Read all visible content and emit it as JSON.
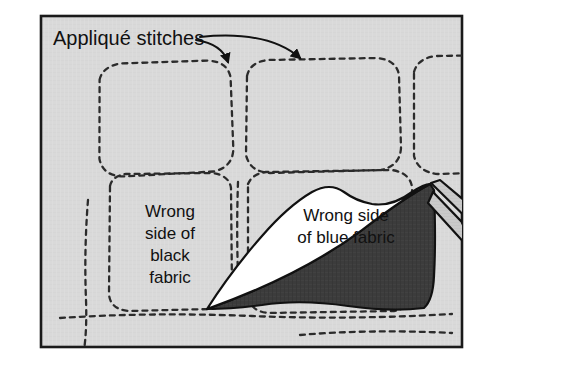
{
  "figure": {
    "frame": {
      "border_color": "#1a1a1a",
      "background_color": "#d9d9d9",
      "page_color": "#ffffff"
    },
    "labels": {
      "callout": {
        "text": "Appliqué stitches",
        "arrows": 2
      },
      "black_fabric": {
        "lines": [
          "Wrong",
          "side of",
          "black",
          "fabric"
        ]
      },
      "blue_fabric": {
        "lines": [
          "Wrong side",
          "of blue fabric"
        ]
      }
    },
    "elements": {
      "stitch_line_name": "applique-stitch-line",
      "patch_count": 5,
      "scissors": {
        "blade_color": "#c9c9c9",
        "handle_color": "#8c8c8c",
        "outline_color": "#111111"
      },
      "fabric_flap": {
        "front_color": "#ffffff",
        "back_color": "#3c3c3c",
        "outline_color": "#111111"
      }
    },
    "colors": {
      "background_gray": "#d9d9d9",
      "dark_fabric": "#3c3c3c",
      "stitch": "#2b2b2b",
      "blade": "#c9c9c9",
      "handle": "#8c8c8c",
      "ink": "#111111"
    }
  }
}
